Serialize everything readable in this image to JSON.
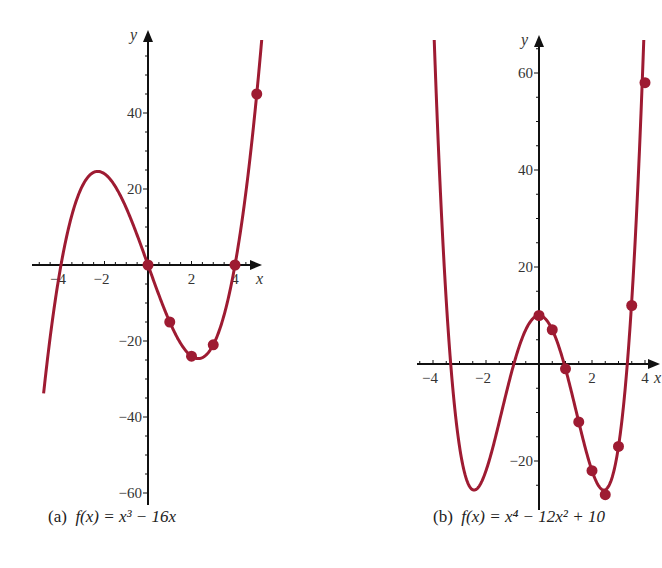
{
  "colors": {
    "curve": "#9e1b32",
    "axis": "#111111",
    "background": "#ffffff"
  },
  "chart_data": [
    {
      "id": "a",
      "type": "line",
      "title": "(a) f(x) = x^3 - 16x",
      "caption_label": "(a)",
      "caption_formula": "f(x) = x³ − 16x",
      "function": "x^3 - 16x",
      "xlabel": "x",
      "ylabel": "y",
      "xlim": [
        -5.4,
        5.2
      ],
      "ylim": [
        -62,
        64
      ],
      "xticks_labeled": [
        -4,
        -2,
        2,
        4
      ],
      "yticks_labeled": [
        40,
        20,
        -20,
        -40,
        -60
      ],
      "grid": false,
      "curve_x_range": [
        -4.8,
        5.3
      ],
      "marked_points": [
        {
          "x": 0,
          "y": 0
        },
        {
          "x": 1,
          "y": -15
        },
        {
          "x": 2,
          "y": -24
        },
        {
          "x": 3,
          "y": -21
        },
        {
          "x": 4,
          "y": 0
        },
        {
          "x": 5,
          "y": 45
        }
      ],
      "local_max": {
        "x": -2.31,
        "y": 24.6
      },
      "local_min": {
        "x": 2.31,
        "y": -24.6
      },
      "roots": [
        -4,
        0,
        4
      ]
    },
    {
      "id": "b",
      "type": "line",
      "title": "(b) f(x) = x^4 - 12x^2 + 10",
      "caption_label": "(b)",
      "caption_formula": "f(x) = x⁴ − 12x² + 10",
      "function": "x^4 - 12x^2 + 10",
      "xlabel": "x",
      "ylabel": "y",
      "xlim": [
        -4.5,
        4.3
      ],
      "ylim": [
        -30,
        66
      ],
      "xticks_labeled": [
        -4,
        -2,
        2,
        4
      ],
      "yticks_labeled": [
        60,
        40,
        20,
        -20
      ],
      "grid": false,
      "curve_x_range": [
        -4.02,
        4.03
      ],
      "marked_points": [
        {
          "x": 0,
          "y": 10
        },
        {
          "x": 0.5,
          "y": 7.06
        },
        {
          "x": 1,
          "y": -1
        },
        {
          "x": 1.5,
          "y": -11.94
        },
        {
          "x": 2,
          "y": -22
        },
        {
          "x": 2.5,
          "y": -26.94
        },
        {
          "x": 3,
          "y": -17
        },
        {
          "x": 3.5,
          "y": 12.06
        },
        {
          "x": 4,
          "y": 58
        }
      ],
      "local_max": {
        "x": 0,
        "y": 10
      },
      "local_min": [
        {
          "x": -2.449,
          "y": -26
        },
        {
          "x": 2.449,
          "y": -26
        }
      ]
    }
  ]
}
